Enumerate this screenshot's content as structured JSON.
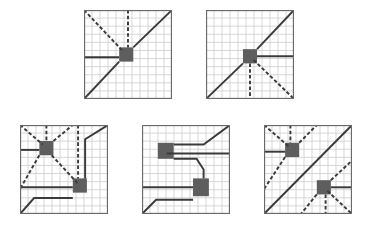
{
  "figure": {
    "colors": {
      "background": "#ffffff",
      "grid": "#c8c8c8",
      "border": "#6a6a6a",
      "line": "#3a3a3a",
      "square": "#5e5e5e"
    },
    "grid_cells": 11,
    "panels": [
      {
        "id": "panel-1",
        "x": 84,
        "y": 10,
        "squares": [
          [
            40,
            42,
            16,
            16
          ]
        ],
        "solid": [
          [
            [
              0,
              100
            ],
            [
              40,
              58
            ]
          ],
          [
            [
              56,
              42
            ],
            [
              100,
              0
            ]
          ],
          [
            [
              0,
              53
            ],
            [
              40,
              53
            ]
          ]
        ],
        "dashed": [
          [
            [
              0,
              0
            ],
            [
              44,
              46
            ]
          ],
          [
            [
              50,
              0
            ],
            [
              50,
              42
            ]
          ]
        ]
      },
      {
        "id": "panel-2",
        "x": 206,
        "y": 10,
        "squares": [
          [
            42,
            44,
            16,
            16
          ]
        ],
        "solid": [
          [
            [
              0,
              100
            ],
            [
              42,
              60
            ]
          ],
          [
            [
              58,
              44
            ],
            [
              100,
              0
            ]
          ],
          [
            [
              58,
              52
            ],
            [
              100,
              52
            ]
          ]
        ],
        "dashed": [
          [
            [
              50,
              60
            ],
            [
              50,
              100
            ]
          ],
          [
            [
              54,
              56
            ],
            [
              100,
              100
            ]
          ]
        ]
      },
      {
        "id": "panel-3",
        "x": 20,
        "y": 125,
        "squares": [
          [
            22,
            18,
            16,
            16
          ],
          [
            60,
            60,
            16,
            16
          ]
        ],
        "solid": [
          [
            [
              0,
              28
            ],
            [
              22,
              28
            ]
          ],
          [
            [
              0,
              70
            ],
            [
              60,
              70
            ]
          ],
          [
            [
              0,
              100
            ],
            [
              16,
              82
            ],
            [
              60,
              82
            ]
          ],
          [
            [
              74,
              60
            ],
            [
              74,
              16
            ],
            [
              100,
              0
            ]
          ]
        ],
        "dashed": [
          [
            [
              0,
              0
            ],
            [
              26,
              22
            ]
          ],
          [
            [
              30,
              0
            ],
            [
              30,
              18
            ]
          ],
          [
            [
              38,
              18
            ],
            [
              60,
              0
            ]
          ],
          [
            [
              22,
              34
            ],
            [
              0,
              72
            ]
          ],
          [
            [
              36,
              34
            ],
            [
              66,
              66
            ]
          ],
          [
            [
              66,
              0
            ],
            [
              66,
              60
            ]
          ]
        ]
      },
      {
        "id": "panel-4",
        "x": 142,
        "y": 125,
        "squares": [
          [
            18,
            20,
            18,
            18
          ],
          [
            58,
            60,
            18,
            20
          ]
        ],
        "solid": [
          [
            [
              36,
              22
            ],
            [
              70,
              22
            ],
            [
              100,
              0
            ]
          ],
          [
            [
              28,
              32
            ],
            [
              100,
              32
            ]
          ],
          [
            [
              36,
              38
            ],
            [
              62,
              38
            ],
            [
              70,
              50
            ],
            [
              70,
              60
            ]
          ],
          [
            [
              0,
              70
            ],
            [
              58,
              70
            ]
          ],
          [
            [
              0,
              100
            ],
            [
              16,
              84
            ],
            [
              58,
              84
            ]
          ]
        ],
        "dashed": []
      },
      {
        "id": "panel-5",
        "x": 264,
        "y": 125,
        "squares": [
          [
            24,
            20,
            16,
            16
          ],
          [
            60,
            62,
            16,
            16
          ]
        ],
        "solid": [
          [
            [
              0,
              100
            ],
            [
              100,
              0
            ]
          ],
          [
            [
              0,
              30
            ],
            [
              24,
              30
            ]
          ],
          [
            [
              76,
              70
            ],
            [
              100,
              70
            ]
          ]
        ],
        "dashed": [
          [
            [
              0,
              0
            ],
            [
              28,
              24
            ]
          ],
          [
            [
              30,
              0
            ],
            [
              30,
              20
            ]
          ],
          [
            [
              40,
              20
            ],
            [
              60,
              0
            ]
          ],
          [
            [
              24,
              36
            ],
            [
              0,
              72
            ]
          ],
          [
            [
              76,
              62
            ],
            [
              100,
              40
            ]
          ],
          [
            [
              60,
              78
            ],
            [
              42,
              100
            ]
          ],
          [
            [
              70,
              78
            ],
            [
              70,
              100
            ]
          ],
          [
            [
              72,
              74
            ],
            [
              100,
              100
            ]
          ]
        ]
      }
    ]
  }
}
